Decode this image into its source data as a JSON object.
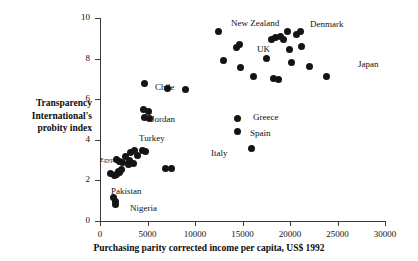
{
  "chart_data": {
    "type": "scatter",
    "title": "",
    "xlabel": "Purchasing parity corrected income per capita, US$ 1992",
    "ylabel": "Transparency International's probity index",
    "xlim": [
      0,
      30000
    ],
    "ylim": [
      0,
      10
    ],
    "xticks": [
      0,
      5000,
      10000,
      15000,
      20000,
      25000,
      30000
    ],
    "xtick_labels": [
      "0",
      "5000",
      "10000",
      "15000",
      "20000",
      "25000",
      "30000"
    ],
    "yticks": [
      0,
      2,
      4,
      6,
      8,
      10
    ],
    "ytick_labels": [
      "0",
      "2",
      "4",
      "6",
      "8",
      "10"
    ],
    "grid": false,
    "legend": false,
    "marker": "filled-circle",
    "marker_color": "#141414",
    "points": [
      {
        "x": 1450,
        "y": 1.15,
        "label": ""
      },
      {
        "x": 1600,
        "y": 0.95,
        "label": ""
      },
      {
        "x": 1650,
        "y": 0.8,
        "label": "Nigeria"
      },
      {
        "x": 1100,
        "y": 2.35,
        "label": ""
      },
      {
        "x": 1500,
        "y": 2.25,
        "label": ""
      },
      {
        "x": 1750,
        "y": 2.3,
        "label": ""
      },
      {
        "x": 1900,
        "y": 2.45,
        "label": ""
      },
      {
        "x": 2100,
        "y": 2.4,
        "label": ""
      },
      {
        "x": 2300,
        "y": 2.55,
        "label": ""
      },
      {
        "x": 1700,
        "y": 3.05,
        "label": "Egypt"
      },
      {
        "x": 2050,
        "y": 2.95,
        "label": ""
      },
      {
        "x": 2400,
        "y": 2.9,
        "label": ""
      },
      {
        "x": 2650,
        "y": 3.2,
        "label": ""
      },
      {
        "x": 3000,
        "y": 2.8,
        "label": ""
      },
      {
        "x": 3150,
        "y": 3.0,
        "label": ""
      },
      {
        "x": 3250,
        "y": 3.35,
        "label": ""
      },
      {
        "x": 3500,
        "y": 2.85,
        "label": ""
      },
      {
        "x": 3600,
        "y": 3.45,
        "label": ""
      },
      {
        "x": 3900,
        "y": 3.25,
        "label": ""
      },
      {
        "x": 4500,
        "y": 3.45,
        "label": "Turkey"
      },
      {
        "x": 4800,
        "y": 3.4,
        "label": ""
      },
      {
        "x": 5200,
        "y": 5.05,
        "label": ""
      },
      {
        "x": 4600,
        "y": 5.5,
        "label": ""
      },
      {
        "x": 5150,
        "y": 5.4,
        "label": "Jordan"
      },
      {
        "x": 4650,
        "y": 5.1,
        "label": ""
      },
      {
        "x": 4650,
        "y": 6.75,
        "label": "Chile"
      },
      {
        "x": 6900,
        "y": 2.6,
        "label": ""
      },
      {
        "x": 7500,
        "y": 2.6,
        "label": ""
      },
      {
        "x": 7100,
        "y": 6.55,
        "label": ""
      },
      {
        "x": 9000,
        "y": 6.5,
        "label": ""
      },
      {
        "x": 12500,
        "y": 9.35,
        "label": ""
      },
      {
        "x": 13000,
        "y": 7.9,
        "label": ""
      },
      {
        "x": 14500,
        "y": 5.05,
        "label": "Greece"
      },
      {
        "x": 14500,
        "y": 4.4,
        "label": "Spain"
      },
      {
        "x": 15900,
        "y": 3.55,
        "label": "Italy"
      },
      {
        "x": 14800,
        "y": 7.55,
        "label": ""
      },
      {
        "x": 14400,
        "y": 8.55,
        "label": "UK"
      },
      {
        "x": 14700,
        "y": 8.7,
        "label": ""
      },
      {
        "x": 16200,
        "y": 7.1,
        "label": ""
      },
      {
        "x": 17500,
        "y": 8.0,
        "label": ""
      },
      {
        "x": 18300,
        "y": 7.0,
        "label": ""
      },
      {
        "x": 18800,
        "y": 6.95,
        "label": ""
      },
      {
        "x": 18000,
        "y": 8.95,
        "label": ""
      },
      {
        "x": 18500,
        "y": 9.05,
        "label": ""
      },
      {
        "x": 19000,
        "y": 9.1,
        "label": ""
      },
      {
        "x": 19300,
        "y": 8.95,
        "label": ""
      },
      {
        "x": 19700,
        "y": 9.35,
        "label": ""
      },
      {
        "x": 19900,
        "y": 8.45,
        "label": ""
      },
      {
        "x": 20200,
        "y": 7.8,
        "label": ""
      },
      {
        "x": 20700,
        "y": 9.2,
        "label": ""
      },
      {
        "x": 21200,
        "y": 8.6,
        "label": ""
      },
      {
        "x": 21100,
        "y": 9.35,
        "label": ""
      },
      {
        "x": 22100,
        "y": 7.6,
        "label": ""
      },
      {
        "x": 23800,
        "y": 7.1,
        "label": "Japan"
      }
    ],
    "annotations": [
      {
        "text": "New Zealand",
        "x_px": 231,
        "y_px": 18,
        "size": "normal"
      },
      {
        "text": "Denmark",
        "x_px": 310,
        "y_px": 19,
        "size": "normal"
      },
      {
        "text": "UK",
        "x_px": 257,
        "y_px": 44,
        "size": "normal"
      },
      {
        "text": "Japan",
        "x_px": 358,
        "y_px": 59,
        "size": "normal"
      },
      {
        "text": "Chile",
        "x_px": 155,
        "y_px": 82,
        "size": "normal"
      },
      {
        "text": "Greece",
        "x_px": 253,
        "y_px": 112,
        "size": "normal"
      },
      {
        "text": "Spain",
        "x_px": 250,
        "y_px": 128,
        "size": "normal"
      },
      {
        "text": "Italy",
        "x_px": 211,
        "y_px": 148,
        "size": "normal"
      },
      {
        "text": "Jordan",
        "x_px": 151,
        "y_px": 114,
        "size": "normal"
      },
      {
        "text": "Turkey",
        "x_px": 139,
        "y_px": 133,
        "size": "normal"
      },
      {
        "text": "Egypt",
        "x_px": 100,
        "y_px": 155,
        "size": "small"
      },
      {
        "text": "Pakistan",
        "x_px": 111,
        "y_px": 186,
        "size": "normal"
      },
      {
        "text": "Nigeria",
        "x_px": 130,
        "y_px": 203,
        "size": "normal"
      }
    ]
  }
}
